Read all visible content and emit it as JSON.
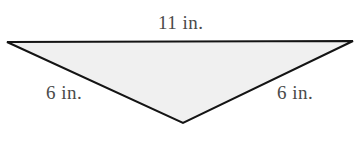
{
  "figure": {
    "name": "obtuse-triangle-with-side-lengths",
    "background_color": "#ffffff",
    "shape": {
      "type": "triangle",
      "fill_color": "#f0f0f0",
      "stroke_color": "#141414",
      "stroke_width": 2,
      "vertices": [
        {
          "name": "top-left-vertex",
          "x": 7,
          "y": 42
        },
        {
          "name": "top-right-vertex",
          "x": 353,
          "y": 41
        },
        {
          "name": "bottom-vertex",
          "x": 183,
          "y": 123
        }
      ],
      "points_attr": "7,42 353,41 183,123"
    },
    "labels": {
      "top": {
        "text": "11 in.",
        "color": "#4a4a4a"
      },
      "left": {
        "text": "6 in.",
        "color": "#4a4a4a"
      },
      "right": {
        "text": "6 in.",
        "color": "#4a4a4a"
      }
    }
  }
}
